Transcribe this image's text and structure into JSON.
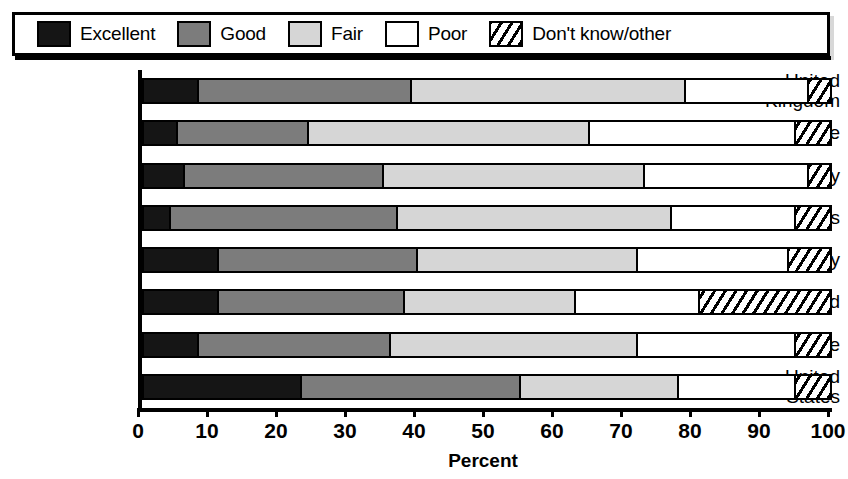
{
  "legend": {
    "items": [
      {
        "label": "Excellent",
        "swatch": "solid-black-swatch",
        "color": "#151515"
      },
      {
        "label": "Good",
        "swatch": "dark-gray-swatch",
        "color": "#7c7c7c"
      },
      {
        "label": "Fair",
        "swatch": "light-gray-swatch",
        "color": "#d6d6d6"
      },
      {
        "label": "Poor",
        "swatch": "white-swatch",
        "color": "#ffffff"
      },
      {
        "label": "Don't know/other",
        "swatch": "hatched-swatch",
        "color": "#ffffff"
      }
    ]
  },
  "chart_data": {
    "type": "bar",
    "orientation": "horizontal",
    "stacked": true,
    "title": "",
    "xlabel": "Percent",
    "ylabel": "",
    "xlim": [
      0,
      100
    ],
    "xticks": [
      0,
      10,
      20,
      30,
      40,
      50,
      60,
      70,
      80,
      90,
      100
    ],
    "xticklabels": [
      "0",
      "10",
      "20",
      "30",
      "40",
      "50",
      "60",
      "70",
      "80",
      "90",
      "100"
    ],
    "grid": false,
    "legend_position": "top",
    "categories": [
      "United\nKingdom",
      "France",
      "Germany",
      "Netherlands",
      "Italy",
      "Poland",
      "Europe",
      "United\nStates"
    ],
    "series": [
      {
        "name": "Excellent",
        "values": [
          8,
          5,
          6,
          4,
          11,
          11,
          8,
          23
        ]
      },
      {
        "name": "Good",
        "values": [
          31,
          19,
          29,
          33,
          29,
          27,
          28,
          32
        ]
      },
      {
        "name": "Fair",
        "values": [
          40,
          41,
          38,
          40,
          32,
          25,
          36,
          23
        ]
      },
      {
        "name": "Poor",
        "values": [
          18,
          30,
          24,
          18,
          22,
          18,
          23,
          17
        ]
      },
      {
        "name": "Don't know/other",
        "values": [
          3,
          5,
          3,
          5,
          6,
          19,
          5,
          5
        ]
      }
    ],
    "cumulative_boundaries": [
      [
        8,
        39,
        79,
        97,
        100
      ],
      [
        5,
        24,
        65,
        95,
        100
      ],
      [
        6,
        35,
        73,
        97,
        100
      ],
      [
        4,
        37,
        77,
        95,
        100
      ],
      [
        11,
        40,
        72,
        94,
        100
      ],
      [
        11,
        38,
        63,
        81,
        100
      ],
      [
        8,
        36,
        72,
        95,
        100
      ],
      [
        23,
        55,
        78,
        95,
        100
      ]
    ]
  }
}
